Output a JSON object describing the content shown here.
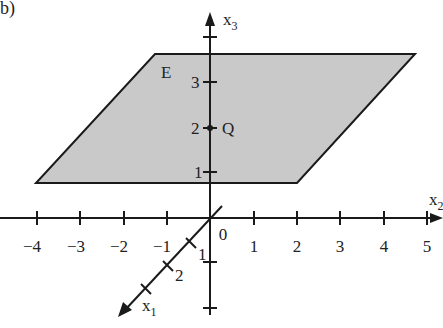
{
  "figure": {
    "part_label": "b)",
    "plane_label": "E",
    "point_label": "Q",
    "axes": {
      "x1": {
        "label": "x",
        "sub": "1",
        "ticks": [
          "1",
          "2"
        ]
      },
      "x2": {
        "label": "x",
        "sub": "2",
        "ticks": [
          "-4",
          "-3",
          "-2",
          "-1",
          "0",
          "1",
          "2",
          "3",
          "4",
          "5"
        ]
      },
      "x3": {
        "label": "x",
        "sub": "3",
        "ticks": [
          "1",
          "2",
          "3"
        ]
      }
    },
    "colors": {
      "plane_fill": "#c8c8c8",
      "line": "#1a1a1a"
    }
  }
}
